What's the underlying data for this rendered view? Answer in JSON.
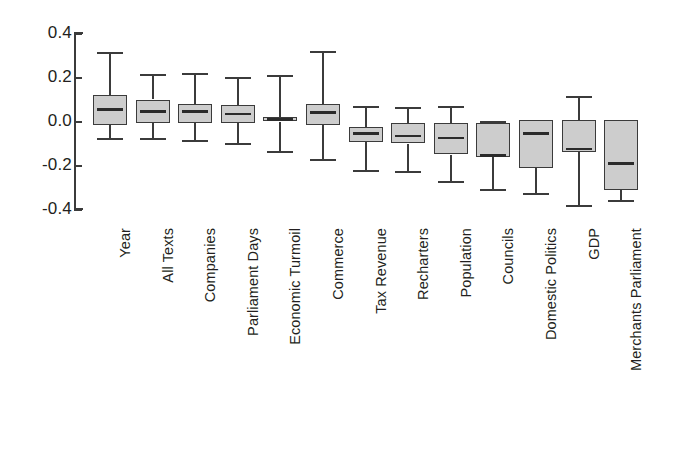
{
  "chart_data": {
    "type": "box",
    "title": "",
    "xlabel": "",
    "ylabel": "",
    "ylim": [
      -0.46,
      0.42
    ],
    "grid": false,
    "legend": null,
    "y_ticks": [
      {
        "label": "0.4",
        "value": 0.4
      },
      {
        "label": "0.2",
        "value": 0.2
      },
      {
        "label": "0.0",
        "value": 0.0
      },
      {
        "label": "-0.2",
        "value": -0.2
      },
      {
        "label": "-0.4",
        "value": -0.4
      }
    ],
    "categories": [
      "Year",
      "All Texts",
      "Companies",
      "Parliament Days",
      "Economic Turmoil",
      "Commerce",
      "Tax Revenue",
      "Recharters",
      "Population",
      "Councils",
      "Domestic Politics",
      "GDP",
      "Merchants Parliament"
    ],
    "boxes": [
      {
        "category": "Year",
        "whisker_high": 0.31,
        "q3": 0.12,
        "median": 0.055,
        "q1": -0.015,
        "whisker_low": -0.08
      },
      {
        "category": "All Texts",
        "whisker_high": 0.21,
        "q3": 0.1,
        "median": 0.045,
        "q1": -0.005,
        "whisker_low": -0.08
      },
      {
        "category": "Companies",
        "whisker_high": 0.215,
        "q3": 0.08,
        "median": 0.045,
        "q1": -0.005,
        "whisker_low": -0.09
      },
      {
        "category": "Parliament Days",
        "whisker_high": 0.2,
        "q3": 0.075,
        "median": 0.035,
        "q1": -0.005,
        "whisker_low": -0.1
      },
      {
        "category": "Economic Turmoil",
        "whisker_high": 0.205,
        "q3": 0.02,
        "median": 0.01,
        "q1": 0.0,
        "whisker_low": -0.14
      },
      {
        "category": "Commerce",
        "whisker_high": 0.315,
        "q3": 0.08,
        "median": 0.04,
        "q1": -0.015,
        "whisker_low": -0.175
      },
      {
        "category": "Tax Revenue",
        "whisker_high": 0.065,
        "q3": -0.025,
        "median": -0.055,
        "q1": -0.095,
        "whisker_low": -0.225
      },
      {
        "category": "Recharters",
        "whisker_high": 0.06,
        "q3": -0.005,
        "median": -0.065,
        "q1": -0.1,
        "whisker_low": -0.23
      },
      {
        "category": "Population",
        "whisker_high": 0.065,
        "q3": -0.005,
        "median": -0.075,
        "q1": -0.15,
        "whisker_low": -0.275
      },
      {
        "category": "Councils",
        "whisker_high": 0.0,
        "q3": -0.005,
        "median": -0.155,
        "q1": -0.16,
        "whisker_low": -0.31
      },
      {
        "category": "Domestic Politics",
        "whisker_high": -0.045,
        "q3": 0.005,
        "median": -0.055,
        "q1": -0.21,
        "whisker_low": -0.33
      },
      {
        "category": "GDP",
        "whisker_high": 0.11,
        "q3": 0.005,
        "median": -0.125,
        "q1": -0.14,
        "whisker_low": -0.385
      },
      {
        "category": "Merchants Parliament",
        "whisker_high": 0.0,
        "q3": 0.005,
        "median": -0.19,
        "q1": -0.31,
        "whisker_low": -0.36
      }
    ],
    "style": {
      "box_fill": "#cdcdcd",
      "box_stroke": "#3b3b3b",
      "median_color": "#2b2b2b",
      "whisker_color": "#3b3b3b",
      "axis_color": "#3b3b3b",
      "text_color": "#231f20",
      "background": "#ffffff"
    }
  }
}
